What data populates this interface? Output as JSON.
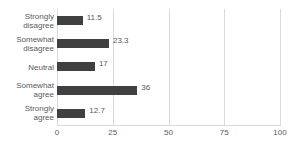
{
  "title_sliver": "",
  "chart_data": {
    "type": "bar",
    "orientation": "horizontal",
    "title": "",
    "xlabel": "",
    "ylabel": "",
    "categories": [
      "Strongly disagree",
      "Somewhat disagree",
      "Neutral",
      "Somewhat agree",
      "Strongly agree"
    ],
    "category_lines": [
      [
        "Strongly",
        "disagree"
      ],
      [
        "Somewhat",
        "disagree"
      ],
      [
        "Neutral",
        ""
      ],
      [
        "Somewhat",
        "agree"
      ],
      [
        "Strongly",
        "agree"
      ]
    ],
    "values": [
      11.5,
      23.3,
      17,
      36,
      12.7
    ],
    "value_labels": [
      "11.5",
      "23.3",
      "17",
      "36",
      "12.7"
    ],
    "xlim": [
      0,
      100
    ],
    "xticks": [
      0,
      25,
      50,
      75,
      100
    ],
    "xtick_labels": [
      "0",
      "25",
      "50",
      "75",
      "100"
    ],
    "grid": true,
    "grid_axis": "x",
    "legend": false,
    "bar_color": "#404040",
    "grid_color": "#D9D9D9",
    "text_color": "#595959"
  }
}
